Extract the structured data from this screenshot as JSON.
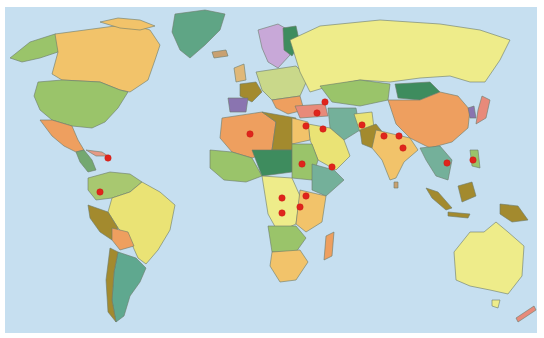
{
  "map": {
    "type": "political world map",
    "ocean_color": "#c6dff0",
    "border_color": "#6b7a6a",
    "marker_color": "#e0241c",
    "markers": [
      {
        "region": "Haiti",
        "x": 108,
        "y": 158
      },
      {
        "region": "Colombia",
        "x": 100,
        "y": 192
      },
      {
        "region": "Algeria",
        "x": 250,
        "y": 134
      },
      {
        "region": "Caucasus",
        "x": 325,
        "y": 102
      },
      {
        "region": "Turkey",
        "x": 317,
        "y": 113
      },
      {
        "region": "Lebanon",
        "x": 306,
        "y": 126
      },
      {
        "region": "Iraq",
        "x": 323,
        "y": 129
      },
      {
        "region": "Sudan",
        "x": 302,
        "y": 164
      },
      {
        "region": "Yemen",
        "x": 332,
        "y": 167
      },
      {
        "region": "Afghanistan",
        "x": 362,
        "y": 125
      },
      {
        "region": "Pakistan/India",
        "x": 384,
        "y": 136
      },
      {
        "region": "Nepal",
        "x": 399,
        "y": 136
      },
      {
        "region": "India",
        "x": 403,
        "y": 148
      },
      {
        "region": "Thailand",
        "x": 447,
        "y": 163
      },
      {
        "region": "Philippines",
        "x": 473,
        "y": 160
      },
      {
        "region": "Central African Republic",
        "x": 282,
        "y": 198
      },
      {
        "region": "Uganda",
        "x": 306,
        "y": 196
      },
      {
        "region": "Rwanda/Burundi",
        "x": 300,
        "y": 207
      },
      {
        "region": "DR Congo",
        "x": 282,
        "y": 213
      }
    ]
  }
}
